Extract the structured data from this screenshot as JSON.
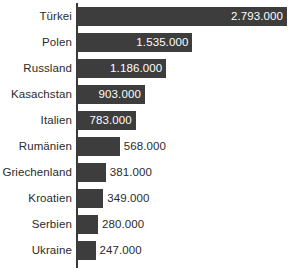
{
  "chart_data": {
    "type": "bar",
    "orientation": "horizontal",
    "title": "",
    "subtitle": "",
    "xlabel": "",
    "ylabel": "",
    "grid": false,
    "legend": null,
    "axis_line": "vertical category axis at left of bars",
    "xlim": [
      0,
      2793000
    ],
    "value_format": "de-DE thousands separator (.)",
    "categories": [
      "Türkei",
      "Polen",
      "Russland",
      "Kasachstan",
      "Italien",
      "Rumänien",
      "Griechenland",
      "Kroatien",
      "Serbien",
      "Ukraine"
    ],
    "values": [
      2793000,
      1535000,
      1186000,
      903000,
      783000,
      568000,
      381000,
      349000,
      280000,
      247000
    ],
    "value_labels": [
      "2.793.000",
      "1.535.000",
      "1.186.000",
      "903.000",
      "783.000",
      "568.000",
      "381.000",
      "349.000",
      "280.000",
      "247.000"
    ],
    "label_placement": [
      "inside",
      "inside",
      "inside",
      "inside",
      "inside",
      "outside",
      "outside",
      "outside",
      "outside",
      "outside"
    ],
    "bar_color": "#3d3d3d",
    "inside_label_color": "#ffffff",
    "outside_label_color": "#2b2b2b",
    "category_label_color": "#2b2b2b",
    "axis_color": "#3a3a3a",
    "background_color": "#ffffff"
  },
  "geometry": {
    "axis_x": 77,
    "row_top": 3,
    "row_pitch": 26,
    "bar_height": 19,
    "px_per_unit": 7.519e-05
  }
}
